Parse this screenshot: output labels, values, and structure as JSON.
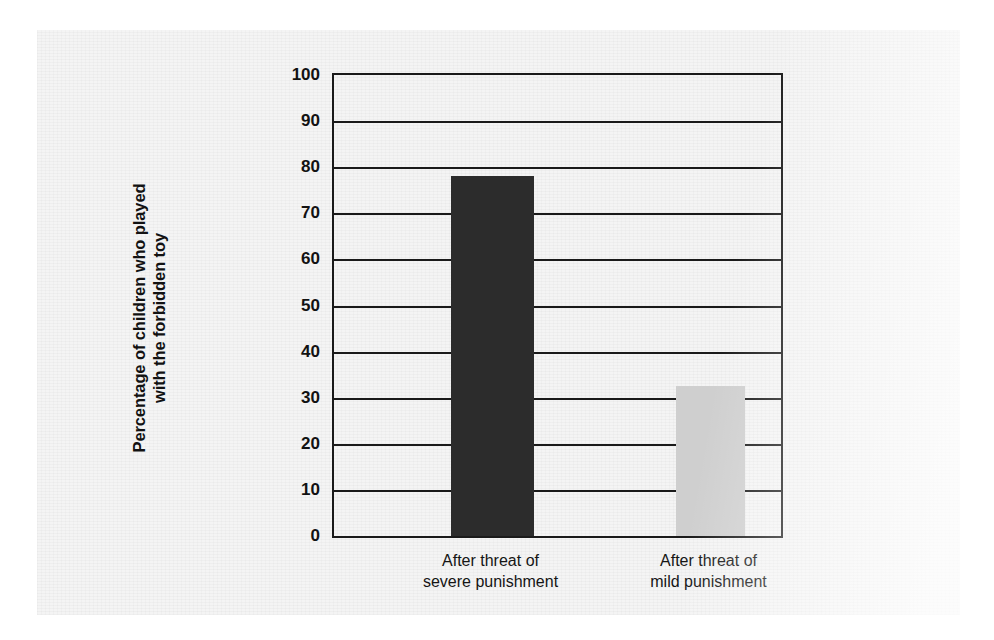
{
  "chart_data": {
    "type": "bar",
    "title": "",
    "xlabel": "",
    "ylabel": "Percentage of children who played with the forbidden toy",
    "ylabel_line1": "Percentage of children who played",
    "ylabel_line2": "with the forbidden toy",
    "categories": [
      "After threat of severe punishment",
      "After threat of mild punishment"
    ],
    "category_lines": [
      [
        "After threat of",
        "severe punishment"
      ],
      [
        "After threat of",
        "mild punishment"
      ]
    ],
    "values": [
      78,
      32.5
    ],
    "ylim": [
      0,
      100
    ],
    "ytick_labels": [
      "100",
      "90",
      "80",
      "70",
      "60",
      "50",
      "40",
      "30",
      "20",
      "10",
      "0"
    ],
    "ytick_values": [
      100,
      90,
      80,
      70,
      60,
      50,
      40,
      30,
      20,
      10,
      0
    ],
    "grid": true,
    "legend": "none",
    "bar_colors": [
      "#2c2c2c",
      "#cfcfcf"
    ],
    "axis_color": "#1a1a1a",
    "background": "#f4f4f4"
  }
}
